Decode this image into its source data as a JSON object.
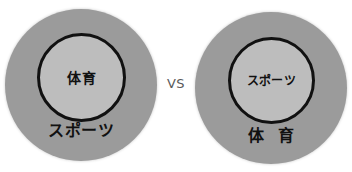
{
  "figure": {
    "background_color": "#ffffff",
    "separator_label": "VS",
    "left": {
      "outer_label": "スポーツ",
      "inner_label": "体育",
      "outer_fill": "#9b9b9b",
      "inner_fill": "#bdbdbd",
      "inner_stroke": "#111111"
    },
    "right": {
      "outer_label": "体 育",
      "inner_label": "スポーツ",
      "outer_fill": "#9b9b9b",
      "inner_fill": "#bdbdbd",
      "inner_stroke": "#111111"
    }
  },
  "chart_data": {
    "type": "diagram",
    "title": "",
    "subtitle": "",
    "diagram_kind": "nested-set-venn-comparison",
    "annotations": [
      "VS"
    ],
    "sets": [
      {
        "side": "left",
        "outer_set": "スポーツ",
        "inner_set": "体育",
        "relation": "体育 ⊂ スポーツ",
        "outer_radius_px": 76,
        "inner_radius_px": 44
      },
      {
        "side": "right",
        "outer_set": "体 育",
        "inner_set": "スポーツ",
        "relation": "スポーツ ⊂ 体育",
        "outer_radius_px": 76,
        "inner_radius_px": 43
      }
    ],
    "legend": [],
    "grid": false
  }
}
